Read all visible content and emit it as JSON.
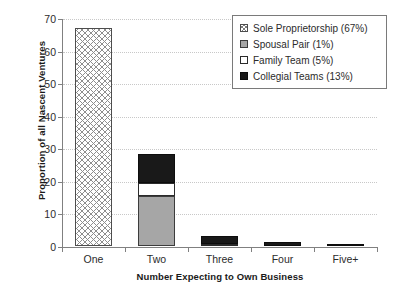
{
  "chart_data": {
    "type": "bar",
    "subtype": "stacked-bar",
    "title": "",
    "xlabel": "Number Expecting to Own Business",
    "ylabel": "Proportion of all Nascent Ventures",
    "categories": [
      "One",
      "Two",
      "Three",
      "Four",
      "Five+"
    ],
    "ylim": [
      0,
      70
    ],
    "yticks": [
      0,
      10,
      20,
      30,
      40,
      50,
      60,
      70
    ],
    "grid": "horizontal-dotted",
    "legend_position": "top-right",
    "series": [
      {
        "name": "Sole Proprietorship (67%)",
        "short_name": "Sole Proprietorship",
        "share": "67%",
        "swatch": "crosshatch",
        "values": [
          67.0,
          0,
          0,
          0,
          0
        ]
      },
      {
        "name": "Spousal Pair (1%)",
        "short_name": "Spousal Pair",
        "share": "1%",
        "swatch": "gray",
        "values": [
          0,
          15.3,
          0,
          0,
          0
        ]
      },
      {
        "name": "Family Team (5%)",
        "short_name": "Family Team",
        "share": "5%",
        "swatch": "white",
        "values": [
          0,
          4.0,
          0.5,
          0,
          0
        ]
      },
      {
        "name": "Collegial Teams (13%)",
        "short_name": "Collegial Teams",
        "share": "13%",
        "swatch": "black",
        "values": [
          0,
          9.1,
          2.6,
          1.3,
          0.4
        ]
      }
    ],
    "totals": [
      67.0,
      28.4,
      3.1,
      1.3,
      0.4
    ]
  },
  "axes": {
    "y_title": "Proportion of all Nascent Ventures",
    "x_title": "Number Expecting to Own Business",
    "y_tick_labels": [
      "0",
      "10",
      "20",
      "30",
      "40",
      "50",
      "60",
      "70"
    ],
    "x_tick_labels": [
      "One",
      "Two",
      "Three",
      "Four",
      "Five+"
    ]
  },
  "legend": {
    "items": [
      {
        "label": "Sole Proprietorship (67%)"
      },
      {
        "label": "Spousal Pair (1%)"
      },
      {
        "label": "Family Team (5%)"
      },
      {
        "label": "Collegial Teams (13%)"
      }
    ]
  },
  "colors": {
    "axis": "#808080",
    "gridline": "#c8c8c8",
    "text": "#2b2b2b",
    "spousal_gray": "#a6a6a6",
    "collegial_black": "#191919",
    "family_white": "#ffffff",
    "legend_border": "#7a7a7a"
  }
}
